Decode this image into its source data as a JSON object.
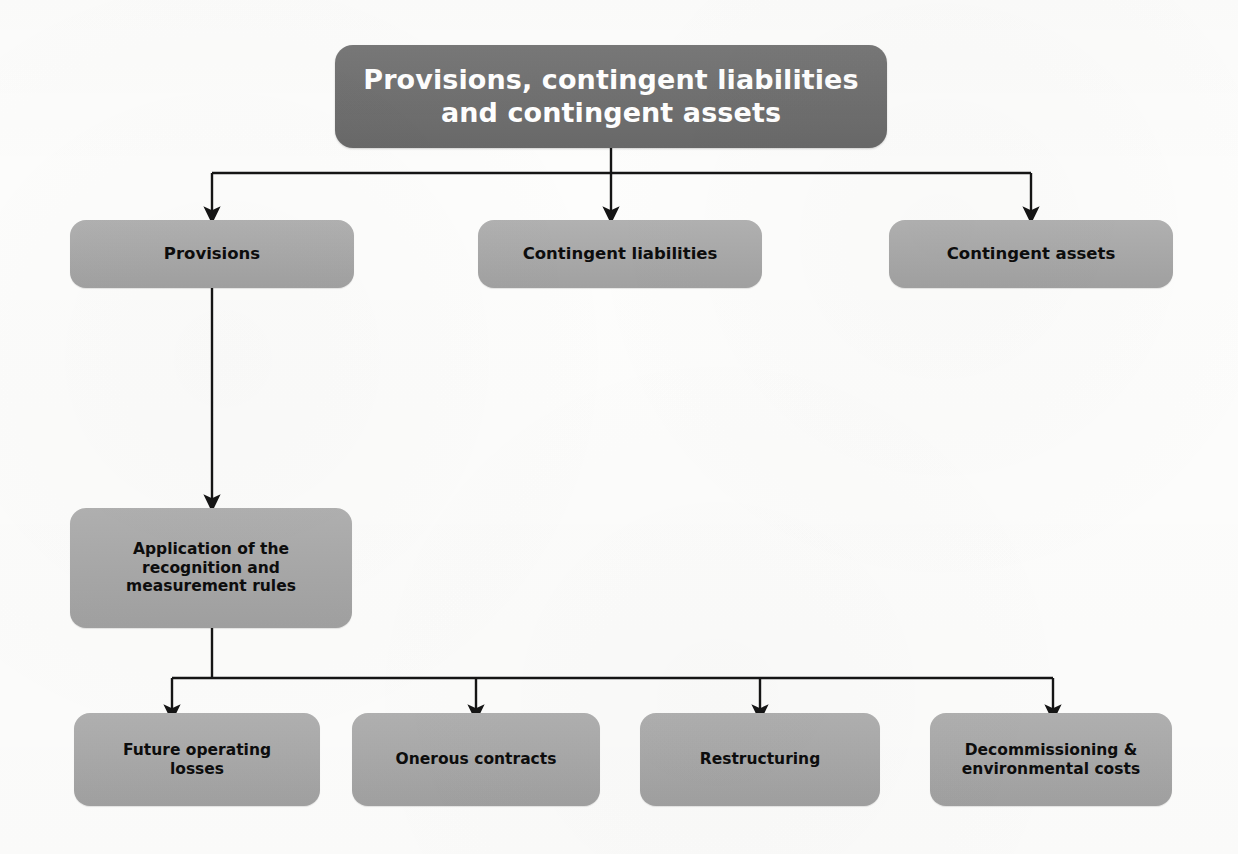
{
  "diagram": {
    "title": "Provisions, contingent liabilities and contingent assets",
    "type": "flowchart",
    "background_color": "#fdfdfc",
    "root_fill": "#6e6e6e",
    "root_text_color": "#ffffff",
    "node_fill": "#a8a8a8",
    "node_text_color": "#0d0d0d",
    "connector_color": "#151515"
  },
  "nodes": {
    "root": {
      "label": "Provisions, contingent liabilities\nand contingent assets",
      "line1": "Provisions, contingent liabilities",
      "line2": "and contingent assets"
    },
    "level2": [
      {
        "id": "provisions",
        "label": "Provisions"
      },
      {
        "id": "contingent-liabilities",
        "label": "Contingent liabilities"
      },
      {
        "id": "contingent-assets",
        "label": "Contingent assets"
      }
    ],
    "level3": [
      {
        "id": "application-rules",
        "label": "Application of the\nrecognition and\nmeasurement rules"
      }
    ],
    "level4": [
      {
        "id": "future-operating-losses",
        "label": "Future operating\nlosses"
      },
      {
        "id": "onerous-contracts",
        "label": "Onerous contracts"
      },
      {
        "id": "restructuring",
        "label": "Restructuring"
      },
      {
        "id": "decommissioning-environmental-costs",
        "label": "Decommissioning &\nenvironmental costs"
      }
    ]
  },
  "connectors": [
    {
      "from": "root",
      "to": "provisions",
      "style": "orthogonal-arrow"
    },
    {
      "from": "root",
      "to": "contingent-liabilities",
      "style": "straight-arrow"
    },
    {
      "from": "root",
      "to": "contingent-assets",
      "style": "orthogonal-arrow"
    },
    {
      "from": "provisions",
      "to": "application-rules",
      "style": "straight-arrow"
    },
    {
      "from": "application-rules",
      "to": "future-operating-losses",
      "style": "orthogonal-arrow"
    },
    {
      "from": "application-rules",
      "to": "onerous-contracts",
      "style": "orthogonal-arrow"
    },
    {
      "from": "application-rules",
      "to": "restructuring",
      "style": "orthogonal-arrow"
    },
    {
      "from": "application-rules",
      "to": "decommissioning-environmental-costs",
      "style": "orthogonal-arrow"
    }
  ]
}
